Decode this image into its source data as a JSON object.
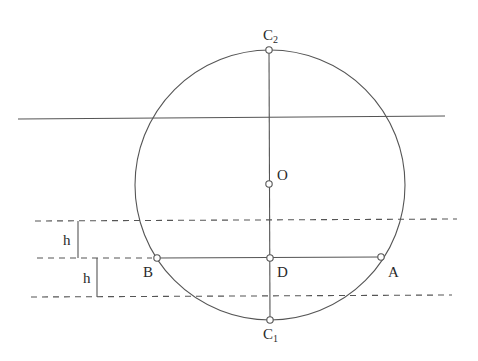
{
  "figure": {
    "type": "geometry-construction",
    "stroke_color": "#555555",
    "background": "#ffffff"
  },
  "points": {
    "C2": {
      "label": "C",
      "subscript": "2",
      "x": 269,
      "y": 50
    },
    "O": {
      "label": "O",
      "x": 269,
      "y": 184
    },
    "D": {
      "label": "D",
      "x": 270,
      "y": 258
    },
    "B": {
      "label": "B",
      "x": 157,
      "y": 258
    },
    "A": {
      "label": "A",
      "x": 381,
      "y": 257
    },
    "C1": {
      "label": "C",
      "subscript": "1",
      "x": 270,
      "y": 320
    }
  },
  "circle": {
    "cx": 270,
    "cy": 185,
    "r": 135
  },
  "lines": {
    "solid_horizontal": {
      "x1": 18,
      "y1": 119,
      "x2": 445,
      "y2": 116
    },
    "vertical_diameter": {
      "x1": 269,
      "y1": 50,
      "x2": 270,
      "y2": 320
    },
    "chord_AB": {
      "x1": 157,
      "y1": 258,
      "x2": 381,
      "y2": 257
    },
    "dashed_upper": {
      "x1": 35,
      "y1": 221,
      "x2": 457,
      "y2": 219
    },
    "dashed_middle": {
      "x1": 37,
      "y1": 258,
      "x2": 152,
      "y2": 258
    },
    "dashed_lower": {
      "x1": 31,
      "y1": 297,
      "x2": 452,
      "y2": 295
    }
  },
  "dimensions": [
    {
      "label": "h",
      "x": 78,
      "y1": 221,
      "y2": 258
    },
    {
      "label": "h",
      "x": 97,
      "y1": 258,
      "y2": 297
    }
  ]
}
